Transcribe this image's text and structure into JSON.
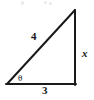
{
  "diagram": {
    "kind": "right-triangle",
    "canvas": {
      "width": 94,
      "height": 100,
      "background_color": "#ffffff"
    },
    "stroke": {
      "color": "#1a1a1a",
      "width": 2
    },
    "vertices": {
      "bottom_left": {
        "x": 7,
        "y": 84
      },
      "bottom_right": {
        "x": 75,
        "y": 84
      },
      "apex": {
        "x": 75,
        "y": 10
      }
    },
    "labels": {
      "hypotenuse": "4",
      "opposite_side": "x",
      "adjacent_side": "3",
      "angle": "θ"
    },
    "label_positions": {
      "hypotenuse": {
        "x": 35,
        "y": 36
      },
      "opposite_side": {
        "x": 85,
        "y": 53
      },
      "adjacent_side": {
        "x": 46,
        "y": 90
      },
      "angle": {
        "x": 21,
        "y": 78
      }
    },
    "sides": [
      {
        "name": "hypotenuse",
        "label": "4",
        "from": "bottom_left",
        "to": "apex"
      },
      {
        "name": "opposite",
        "label": "x",
        "from": "bottom_right",
        "to": "apex"
      },
      {
        "name": "adjacent",
        "label": "3",
        "from": "bottom_left",
        "to": "bottom_right"
      }
    ]
  }
}
